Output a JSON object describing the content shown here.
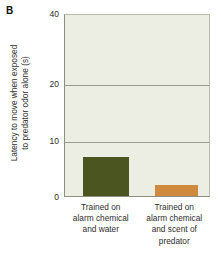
{
  "panel": {
    "label": "B"
  },
  "chart_data": {
    "type": "bar",
    "title": "",
    "xlabel": "",
    "ylabel": "Latency to move when exposed to predator odor alone (s)",
    "ylabel_lines": [
      "Latency to move when exposed",
      "to predator odor alone (s)"
    ],
    "categories": [
      "Trained on alarm chemical and water",
      "Trained on alarm chemical and scent of predator"
    ],
    "category_lines": [
      [
        "Trained on",
        "alarm chemical",
        "and water"
      ],
      [
        "Trained on",
        "alarm chemical",
        "and scent of",
        "predator"
      ]
    ],
    "values": [
      7,
      2
    ],
    "ylim": [
      0,
      40
    ],
    "ytick_labels": [
      "40",
      "20",
      "10",
      "0"
    ],
    "ytick_values": [
      40,
      20,
      10,
      0
    ],
    "gridlines": [
      20,
      10
    ],
    "grid": true,
    "legend": "none",
    "bar_colors": [
      "#4a5520",
      "#d08a3e"
    ]
  },
  "colors": {
    "plot_background": "#eceee3",
    "gridline": "#9a9c90",
    "axis": "#8d8f84",
    "bar_green": "#4a5520",
    "bar_orange": "#d08a3e",
    "text": "#2e2e2c"
  }
}
